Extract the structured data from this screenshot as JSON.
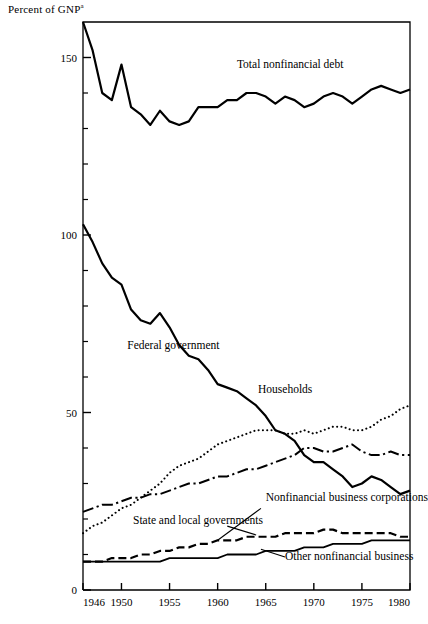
{
  "figure": {
    "y_axis_title": "Percent of GNP",
    "y_axis_title_superscript": "a",
    "background": "#ffffff",
    "ink": "#000000"
  },
  "chart_data": {
    "type": "line",
    "title": "",
    "subtitle": "",
    "xlabel": "",
    "ylabel": "Percent of GNP",
    "ylabel_superscript": "a",
    "xlim": [
      1946,
      1980
    ],
    "ylim": [
      0,
      160
    ],
    "grid": false,
    "legend_position": "inline-annotations",
    "x_tick_labels": [
      "1946",
      "1950",
      "1955",
      "1960",
      "1965",
      "1970",
      "1975",
      "1980"
    ],
    "x_ticks": [
      1946,
      1950,
      1955,
      1960,
      1965,
      1970,
      1975,
      1980
    ],
    "y_tick_labels": [
      "0",
      "50",
      "100",
      "150"
    ],
    "y_ticks": [
      0,
      50,
      100,
      150
    ],
    "y_minor_ticks": [
      10,
      20,
      30,
      40,
      60,
      70,
      80,
      90,
      110,
      120,
      130,
      140
    ],
    "x": [
      1946,
      1947,
      1948,
      1949,
      1950,
      1951,
      1952,
      1953,
      1954,
      1955,
      1956,
      1957,
      1958,
      1959,
      1960,
      1961,
      1962,
      1963,
      1964,
      1965,
      1966,
      1967,
      1968,
      1969,
      1970,
      1971,
      1972,
      1973,
      1974,
      1975,
      1976,
      1977,
      1978,
      1979,
      1980
    ],
    "series": [
      {
        "name": "Total nonfinancial debt",
        "style": "solid",
        "linewidth": 2.2,
        "label_x": 1962.0,
        "label_y": 147.0,
        "values": [
          160.0,
          152.0,
          140.0,
          138.0,
          148.0,
          136.0,
          134.0,
          131.0,
          135.0,
          132.0,
          131.0,
          132.0,
          136.0,
          136.0,
          136.0,
          138.0,
          138.0,
          140.0,
          140.0,
          139.0,
          137.0,
          139.0,
          138.0,
          136.0,
          137.0,
          139.0,
          140.0,
          139.0,
          137.0,
          139.0,
          141.0,
          142.0,
          141.0,
          140.0,
          141.0
        ]
      },
      {
        "name": "Federal government",
        "style": "solid",
        "linewidth": 2.2,
        "label_x": 1950.6,
        "label_y": 68.0,
        "values": [
          103.0,
          98.0,
          92.0,
          88.0,
          86.0,
          79.0,
          76.0,
          75.0,
          78.0,
          74.0,
          69.0,
          66.0,
          65.0,
          62.0,
          58.0,
          57.0,
          56.0,
          54.0,
          52.0,
          49.0,
          45.0,
          44.0,
          42.0,
          38.0,
          36.0,
          36.0,
          34.0,
          32.0,
          29.0,
          30.0,
          32.0,
          31.0,
          29.0,
          27.0,
          28.0
        ]
      },
      {
        "name": "Households",
        "style": "dotted",
        "linewidth": 2.0,
        "label_x": 1964.2,
        "label_y": 55.5,
        "values": [
          16.0,
          18.0,
          19.0,
          21.0,
          23.0,
          24.0,
          26.0,
          28.0,
          30.0,
          33.0,
          35.0,
          36.0,
          37.0,
          39.0,
          41.0,
          42.0,
          43.0,
          44.0,
          45.0,
          45.0,
          45.0,
          44.0,
          44.0,
          45.0,
          44.0,
          45.0,
          46.0,
          46.0,
          45.0,
          45.0,
          46.0,
          48.0,
          49.0,
          51.0,
          52.0
        ]
      },
      {
        "name": "Nonfinancial business corporations",
        "style": "dashdot",
        "linewidth": 2.0,
        "label_x": 1965.0,
        "label_y": 25.0,
        "values": [
          22.0,
          23.0,
          24.0,
          24.0,
          25.0,
          26.0,
          26.0,
          27.0,
          27.0,
          28.0,
          29.0,
          30.0,
          30.0,
          31.0,
          32.0,
          32.0,
          33.0,
          34.0,
          34.0,
          35.0,
          36.0,
          37.0,
          38.0,
          40.0,
          40.0,
          39.0,
          39.0,
          40.0,
          41.0,
          39.0,
          38.0,
          38.0,
          39.0,
          38.0,
          38.0
        ]
      },
      {
        "name": "State and local governments",
        "style": "dashed",
        "linewidth": 2.2,
        "label_x": 1951.2,
        "label_y": 18.5,
        "values": [
          8.0,
          8.0,
          8.0,
          9.0,
          9.0,
          9.0,
          10.0,
          10.0,
          11.0,
          11.0,
          12.0,
          12.0,
          13.0,
          13.0,
          14.0,
          14.0,
          14.0,
          15.0,
          15.0,
          15.0,
          15.0,
          16.0,
          16.0,
          16.0,
          16.0,
          17.0,
          17.0,
          16.0,
          16.0,
          16.0,
          16.0,
          16.0,
          16.0,
          15.0,
          15.0
        ]
      },
      {
        "name": "Other nonfinancial business",
        "style": "solid",
        "linewidth": 1.8,
        "label_x": 1967.0,
        "label_y": 8.5,
        "values": [
          8.0,
          8.0,
          8.0,
          8.0,
          8.0,
          8.0,
          8.0,
          8.0,
          8.0,
          9.0,
          9.0,
          9.0,
          9.0,
          9.0,
          9.0,
          10.0,
          10.0,
          10.0,
          10.0,
          11.0,
          11.0,
          11.0,
          11.0,
          12.0,
          12.0,
          12.0,
          13.0,
          13.0,
          13.0,
          13.0,
          14.0,
          14.0,
          14.0,
          14.0,
          14.0
        ]
      }
    ],
    "annotations": [
      {
        "text": "Total nonfinancial debt",
        "series": "Total nonfinancial debt"
      },
      {
        "text": "Federal government",
        "series": "Federal government"
      },
      {
        "text": "Households",
        "series": "Households"
      },
      {
        "text": "Nonfinancial business corporations",
        "series": "Nonfinancial business corporations"
      },
      {
        "text": "State and local governments",
        "series": "State and local governments"
      },
      {
        "text": "Other nonfinancial business",
        "series": "Other nonfinancial business"
      }
    ],
    "leader_lines": [
      {
        "series": "Nonfinancial business corporations",
        "x1": 1960.0,
        "y1": 14.0,
        "x2": 1964.5,
        "y2": 23.0
      },
      {
        "series": "State and local governments",
        "x1": 1961.0,
        "y1": 18.0,
        "x2": 1964.0,
        "y2": 15.5
      },
      {
        "series": "Other nonfinancial business",
        "x1": 1964.5,
        "y1": 11.5,
        "x2": 1967.0,
        "y2": 9.3
      }
    ]
  }
}
